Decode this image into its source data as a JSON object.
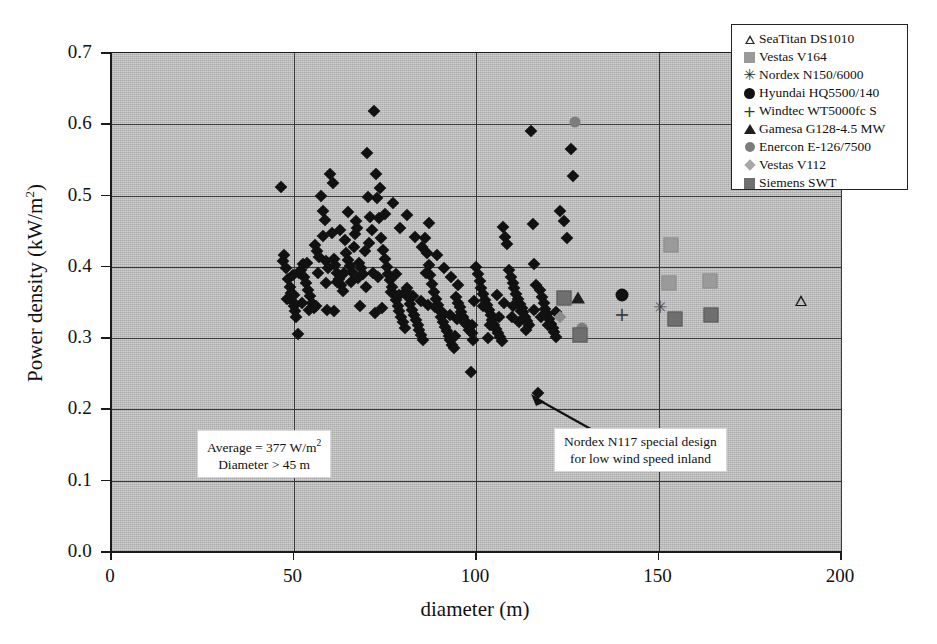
{
  "chart_data": {
    "type": "scatter",
    "title": "",
    "xlabel": "diameter (m)",
    "ylabel_text": "Power density (kW/m",
    "ylabel_sup": "2",
    "ylabel_tail": ")",
    "xlim": [
      0,
      200
    ],
    "ylim": [
      0.0,
      0.7
    ],
    "xticks": [
      0,
      50,
      100,
      150,
      200
    ],
    "xtick_labels": [
      "0",
      "50",
      "100",
      "150",
      "200"
    ],
    "yticks": [
      0.0,
      0.1,
      0.2,
      0.3,
      0.4,
      0.5,
      0.6,
      0.7
    ],
    "ytick_labels": [
      "0.0",
      "0.1",
      "0.2",
      "0.3",
      "0.4",
      "0.5",
      "0.6",
      "0.7"
    ],
    "grid": "both",
    "legend_position": "top-right",
    "plot_background": "#bfbfbf",
    "series": [
      {
        "name": "general wind turbines",
        "marker": "diamond",
        "color": "#111111",
        "points": [
          [
            46.5,
            0.512
          ],
          [
            47.0,
            0.408
          ],
          [
            47.5,
            0.417
          ],
          [
            48.0,
            0.399
          ],
          [
            48.5,
            0.383
          ],
          [
            49.0,
            0.372
          ],
          [
            49.3,
            0.364
          ],
          [
            49.6,
            0.352
          ],
          [
            50.0,
            0.345
          ],
          [
            50.4,
            0.338
          ],
          [
            50.8,
            0.33
          ],
          [
            51.2,
            0.306
          ],
          [
            52.0,
            0.395
          ],
          [
            52.5,
            0.404
          ],
          [
            53.0,
            0.386
          ],
          [
            53.5,
            0.377
          ],
          [
            54.0,
            0.368
          ],
          [
            54.5,
            0.359
          ],
          [
            55.0,
            0.35
          ],
          [
            55.5,
            0.342
          ],
          [
            56.0,
            0.43
          ],
          [
            56.5,
            0.422
          ],
          [
            57.0,
            0.414
          ],
          [
            58.0,
            0.478
          ],
          [
            58.5,
            0.466
          ],
          [
            59.0,
            0.408
          ],
          [
            59.5,
            0.398
          ],
          [
            60.0,
            0.53
          ],
          [
            60.5,
            0.448
          ],
          [
            61.0,
            0.411
          ],
          [
            61.5,
            0.402
          ],
          [
            62.0,
            0.392
          ],
          [
            62.5,
            0.383
          ],
          [
            63.0,
            0.374
          ],
          [
            63.5,
            0.366
          ],
          [
            64.0,
            0.437
          ],
          [
            64.5,
            0.419
          ],
          [
            65.0,
            0.41
          ],
          [
            65.5,
            0.401
          ],
          [
            66.0,
            0.393
          ],
          [
            66.5,
            0.428
          ],
          [
            67.0,
            0.465
          ],
          [
            67.5,
            0.455
          ],
          [
            68.0,
            0.406
          ],
          [
            68.5,
            0.398
          ],
          [
            69.0,
            0.39
          ],
          [
            70.0,
            0.56
          ],
          [
            70.5,
            0.498
          ],
          [
            71.0,
            0.47
          ],
          [
            71.5,
            0.452
          ],
          [
            72.0,
            0.618
          ],
          [
            72.5,
            0.53
          ],
          [
            73.0,
            0.497
          ],
          [
            73.5,
            0.468
          ],
          [
            74.0,
            0.44
          ],
          [
            74.5,
            0.424
          ],
          [
            75.0,
            0.411
          ],
          [
            75.5,
            0.4
          ],
          [
            76.0,
            0.39
          ],
          [
            76.5,
            0.381
          ],
          [
            77.0,
            0.372
          ],
          [
            77.5,
            0.362
          ],
          [
            78.0,
            0.353
          ],
          [
            78.5,
            0.345
          ],
          [
            79.0,
            0.338
          ],
          [
            79.5,
            0.33
          ],
          [
            80.0,
            0.322
          ],
          [
            80.5,
            0.314
          ],
          [
            81.0,
            0.37
          ],
          [
            81.5,
            0.358
          ],
          [
            82.0,
            0.348
          ],
          [
            82.5,
            0.34
          ],
          [
            83.0,
            0.332
          ],
          [
            83.5,
            0.325
          ],
          [
            84.0,
            0.318
          ],
          [
            84.5,
            0.311
          ],
          [
            85.0,
            0.304
          ],
          [
            85.5,
            0.298
          ],
          [
            86.0,
            0.44
          ],
          [
            86.5,
            0.42
          ],
          [
            87.0,
            0.403
          ],
          [
            87.5,
            0.389
          ],
          [
            88.0,
            0.376
          ],
          [
            88.5,
            0.365
          ],
          [
            89.0,
            0.355
          ],
          [
            89.5,
            0.346
          ],
          [
            90.0,
            0.338
          ],
          [
            90.5,
            0.33
          ],
          [
            91.0,
            0.323
          ],
          [
            91.5,
            0.316
          ],
          [
            92.0,
            0.31
          ],
          [
            92.5,
            0.303
          ],
          [
            93.0,
            0.297
          ],
          [
            93.5,
            0.291
          ],
          [
            94.0,
            0.286
          ],
          [
            94.5,
            0.358
          ],
          [
            95.0,
            0.35
          ],
          [
            95.5,
            0.343
          ],
          [
            96.0,
            0.336
          ],
          [
            96.5,
            0.33
          ],
          [
            97.0,
            0.324
          ],
          [
            97.5,
            0.318
          ],
          [
            98.0,
            0.312
          ],
          [
            98.5,
            0.253
          ],
          [
            99.0,
            0.307
          ],
          [
            100.0,
            0.4
          ],
          [
            100.5,
            0.39
          ],
          [
            101.0,
            0.38
          ],
          [
            101.5,
            0.371
          ],
          [
            102.0,
            0.362
          ],
          [
            102.5,
            0.354
          ],
          [
            103.0,
            0.346
          ],
          [
            103.5,
            0.339
          ],
          [
            104.0,
            0.332
          ],
          [
            104.5,
            0.325
          ],
          [
            105.0,
            0.319
          ],
          [
            105.5,
            0.313
          ],
          [
            106.0,
            0.307
          ],
          [
            106.5,
            0.301
          ],
          [
            107.0,
            0.296
          ],
          [
            107.5,
            0.456
          ],
          [
            108.0,
            0.442
          ],
          [
            108.5,
            0.432
          ],
          [
            109.0,
            0.396
          ],
          [
            109.5,
            0.386
          ],
          [
            110.0,
            0.378
          ],
          [
            110.5,
            0.37
          ],
          [
            111.0,
            0.362
          ],
          [
            111.5,
            0.355
          ],
          [
            112.0,
            0.348
          ],
          [
            112.5,
            0.342
          ],
          [
            113.0,
            0.336
          ],
          [
            113.5,
            0.33
          ],
          [
            114.0,
            0.324
          ],
          [
            114.5,
            0.319
          ],
          [
            115.0,
            0.59
          ],
          [
            115.5,
            0.46
          ],
          [
            116.0,
            0.404
          ],
          [
            116.5,
            0.375
          ],
          [
            117.0,
            0.223
          ],
          [
            117.5,
            0.368
          ],
          [
            118.0,
            0.358
          ],
          [
            118.5,
            0.349
          ],
          [
            119.0,
            0.341
          ],
          [
            119.5,
            0.334
          ],
          [
            120.0,
            0.327
          ],
          [
            120.5,
            0.32
          ],
          [
            121.0,
            0.314
          ],
          [
            121.5,
            0.308
          ],
          [
            122.0,
            0.302
          ],
          [
            123.0,
            0.478
          ],
          [
            124.0,
            0.465
          ],
          [
            125.0,
            0.44
          ],
          [
            126.0,
            0.566
          ],
          [
            126.5,
            0.527
          ],
          [
            57.5,
            0.5
          ],
          [
            58.2,
            0.443
          ],
          [
            60.8,
            0.518
          ],
          [
            62.8,
            0.452
          ],
          [
            64.8,
            0.477
          ],
          [
            66.8,
            0.446
          ],
          [
            69.5,
            0.422
          ],
          [
            70.8,
            0.434
          ],
          [
            73.8,
            0.511
          ],
          [
            75.2,
            0.474
          ],
          [
            77.2,
            0.49
          ],
          [
            79.2,
            0.455
          ],
          [
            81.2,
            0.473
          ],
          [
            83.2,
            0.442
          ],
          [
            85.2,
            0.428
          ],
          [
            87.2,
            0.461
          ],
          [
            89.2,
            0.417
          ],
          [
            91.2,
            0.398
          ],
          [
            93.2,
            0.386
          ],
          [
            95.2,
            0.375
          ],
          [
            49.8,
            0.388
          ],
          [
            51.5,
            0.392
          ],
          [
            53.8,
            0.406
          ],
          [
            56.8,
            0.392
          ],
          [
            58.8,
            0.377
          ],
          [
            61.8,
            0.379
          ],
          [
            63.8,
            0.392
          ],
          [
            65.8,
            0.379
          ],
          [
            67.8,
            0.385
          ],
          [
            69.8,
            0.372
          ],
          [
            71.8,
            0.392
          ],
          [
            73.2,
            0.386
          ],
          [
            76.8,
            0.365
          ],
          [
            78.8,
            0.36
          ],
          [
            80.8,
            0.366
          ],
          [
            82.8,
            0.359
          ],
          [
            84.8,
            0.352
          ],
          [
            86.8,
            0.347
          ],
          [
            88.8,
            0.343
          ],
          [
            90.8,
            0.336
          ],
          [
            92.8,
            0.332
          ],
          [
            94.8,
            0.327
          ],
          [
            96.8,
            0.322
          ],
          [
            98.8,
            0.318
          ],
          [
            99.5,
            0.352
          ],
          [
            101.8,
            0.345
          ],
          [
            103.8,
            0.318
          ],
          [
            105.8,
            0.36
          ],
          [
            107.8,
            0.35
          ],
          [
            109.8,
            0.33
          ],
          [
            111.8,
            0.322
          ],
          [
            113.8,
            0.312
          ],
          [
            115.8,
            0.34
          ],
          [
            117.8,
            0.33
          ],
          [
            119.8,
            0.318
          ],
          [
            48.2,
            0.355
          ],
          [
            50.2,
            0.36
          ],
          [
            52.2,
            0.35
          ],
          [
            54.2,
            0.34
          ],
          [
            56.2,
            0.345
          ],
          [
            59.2,
            0.34
          ],
          [
            61.2,
            0.338
          ],
          [
            68.2,
            0.345
          ],
          [
            72.2,
            0.335
          ],
          [
            74.2,
            0.342
          ],
          [
            78.2,
            0.39
          ],
          [
            86.2,
            0.392
          ],
          [
            94.2,
            0.303
          ],
          [
            99.2,
            0.298
          ],
          [
            103.2,
            0.3
          ],
          [
            106.2,
            0.33
          ],
          [
            110.2,
            0.345
          ],
          [
            112.2,
            0.338
          ],
          [
            121.8,
            0.336
          ]
        ]
      },
      {
        "name": "SeaTitan DS1010",
        "marker": "triangle-open",
        "color": "#1a1a1a",
        "points": [
          [
            189.0,
            0.352
          ]
        ]
      },
      {
        "name": "Vestas V164",
        "marker": "square-light",
        "color": "#9a9a9a",
        "points": [
          [
            153.5,
            0.43
          ],
          [
            153.0,
            0.378
          ],
          [
            164.0,
            0.38
          ]
        ]
      },
      {
        "name": "Nordex N150/6000",
        "marker": "star",
        "color": "#4a4a4a",
        "points": [
          [
            150.5,
            0.344
          ]
        ]
      },
      {
        "name": "Hyundai HQ5500/140",
        "marker": "circle-filled",
        "color": "#111111",
        "points": [
          [
            140.0,
            0.36
          ]
        ]
      },
      {
        "name": "Windtec WT5000fc S",
        "marker": "plus",
        "color": "#3d3d3d",
        "points": [
          [
            140.0,
            0.334
          ]
        ]
      },
      {
        "name": "Gamesa G128-4.5 MW",
        "marker": "triangle-filled",
        "color": "#1f1f1f",
        "points": [
          [
            128.0,
            0.356
          ]
        ]
      },
      {
        "name": "Enercon E-126/7500",
        "marker": "circle-gray",
        "color": "#7d7d7d",
        "points": [
          [
            127.0,
            0.603
          ],
          [
            129.0,
            0.314
          ]
        ]
      },
      {
        "name": "Vestas V112",
        "marker": "diamond-gray",
        "color": "#a8a8a8",
        "points": [
          [
            123.0,
            0.33
          ]
        ]
      },
      {
        "name": "Siemens SWT",
        "marker": "square-dark",
        "color": "#6f6f6f",
        "points": [
          [
            124.0,
            0.357
          ],
          [
            128.5,
            0.305
          ],
          [
            154.5,
            0.327
          ],
          [
            164.5,
            0.333
          ]
        ]
      }
    ],
    "annotations": [
      {
        "name": "average-note",
        "line1_pre": "Average = 377 W/m",
        "line1_sup": "2",
        "line2": "Diameter > 45 m"
      },
      {
        "name": "nordex-note",
        "line1": "Nordex N117 special design",
        "line2": "for low wind speed inland"
      }
    ]
  },
  "legend": {
    "items": [
      {
        "label": "SeaTitan DS1010",
        "symbol": "triangle-open-icon"
      },
      {
        "label": "Vestas V164",
        "symbol": "square-light-icon"
      },
      {
        "label": "Nordex N150/6000",
        "symbol": "star-icon"
      },
      {
        "label": "Hyundai HQ5500/140",
        "symbol": "circle-filled-icon"
      },
      {
        "label": "Windtec WT5000fc S",
        "symbol": "plus-icon"
      },
      {
        "label": "Gamesa G128-4.5 MW",
        "symbol": "triangle-filled-icon"
      },
      {
        "label": "Enercon E-126/7500",
        "symbol": "circle-gray-icon"
      },
      {
        "label": "Vestas V112",
        "symbol": "diamond-gray-icon"
      },
      {
        "label": "Siemens SWT",
        "symbol": "square-dark-icon"
      }
    ]
  }
}
